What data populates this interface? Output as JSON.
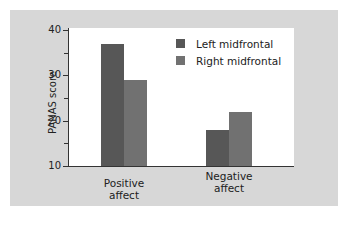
{
  "chart_data": {
    "type": "bar",
    "title": "",
    "xlabel": "",
    "ylabel": "PANAS score",
    "ylim": [
      10,
      40
    ],
    "yticks_major": [
      10,
      20,
      30,
      40
    ],
    "yticks_minor": [
      15,
      25,
      35
    ],
    "categories": [
      "Positive affect",
      "Negative affect"
    ],
    "category_lines": [
      [
        "Positive",
        "affect"
      ],
      [
        "Negative",
        "affect"
      ]
    ],
    "series": [
      {
        "name": "Left midfrontal",
        "color": "#575757",
        "values": [
          37,
          18
        ]
      },
      {
        "name": "Right midfrontal",
        "color": "#717171",
        "values": [
          29,
          22
        ]
      }
    ],
    "legend_position": "upper right",
    "grid": false
  },
  "colors": {
    "panel_background": "#d7d7d7",
    "plot_background": "#ffffff",
    "axis": "#333333"
  }
}
